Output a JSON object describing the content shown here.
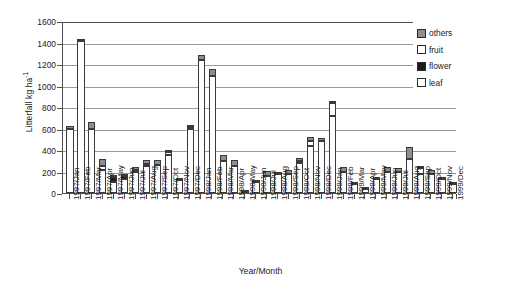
{
  "chart_data": {
    "type": "bar",
    "stacked": true,
    "title": "",
    "xlabel": "Year/Month",
    "ylabel": "Litterfall kg ha-1",
    "ylabel_html": "Litterfall kg ha<sup>-1</sup>",
    "ylim": [
      0,
      1600
    ],
    "ytick_step": 200,
    "yticks": [
      0,
      200,
      400,
      600,
      800,
      1000,
      1200,
      1400,
      1600
    ],
    "grid": true,
    "grid_axis": "y",
    "legend_position": "top-right",
    "legend": [
      "others",
      "fruit",
      "flower",
      "leaf"
    ],
    "series_order_bottom_to_top": [
      "leaf",
      "flower",
      "fruit",
      "others"
    ],
    "colors": {
      "leaf": "#ffffff",
      "flower": "#1c1c1c",
      "fruit": "#ffffff",
      "others": "#8f8f8f",
      "outline": "#3a3a3a",
      "axis": "#4d4d4d",
      "gridline": "#9a9a9a",
      "background": "#ffffff"
    },
    "categories": [
      "1997/Jan",
      "1997/Feb",
      "1997/Mar",
      "1997/Apr",
      "1997/May",
      "1997/Jun",
      "1997/Jul",
      "1997/Aug",
      "1997/Sep",
      "1997/Oct",
      "1997/Nov",
      "1997/Dec",
      "1998/Jan",
      "1998/Feb",
      "1998/Mar",
      "1998/Apr",
      "1998/May",
      "1998/Jun",
      "1998/Jul",
      "1998/Aug",
      "1998/Sep",
      "1998/Oct",
      "1998/Nov",
      "1998/Dec",
      "1999/Jan",
      "1999/Feb",
      "1999/Mar",
      "1999/Apr",
      "1999/May",
      "1999/Jun",
      "1999/Jul",
      "1999/Aug",
      "1999/Sep",
      "1999/Oct",
      "1999/Nov",
      "1999/Dec"
    ],
    "series": [
      {
        "name": "leaf",
        "values": [
          600,
          1415,
          600,
          210,
          100,
          135,
          200,
          255,
          265,
          350,
          120,
          600,
          1240,
          1090,
          295,
          255,
          10,
          105,
          160,
          175,
          180,
          275,
          440,
          480,
          720,
          200,
          85,
          40,
          130,
          195,
          195,
          320,
          175,
          180,
          130,
          85
        ]
      },
      {
        "name": "flower",
        "values": [
          0,
          0,
          0,
          0,
          45,
          20,
          10,
          15,
          0,
          0,
          0,
          0,
          0,
          0,
          0,
          0,
          0,
          0,
          0,
          0,
          0,
          0,
          0,
          0,
          0,
          0,
          0,
          0,
          0,
          0,
          0,
          0,
          0,
          0,
          0,
          0
        ]
      },
      {
        "name": "fruit",
        "values": [
          0,
          0,
          0,
          45,
          0,
          0,
          0,
          0,
          0,
          30,
          5,
          15,
          0,
          0,
          0,
          0,
          0,
          0,
          0,
          0,
          0,
          20,
          45,
          0,
          115,
          0,
          0,
          0,
          0,
          0,
          0,
          0,
          55,
          0,
          0,
          0
        ]
      },
      {
        "name": "others",
        "values": [
          25,
          20,
          60,
          60,
          20,
          15,
          30,
          35,
          45,
          20,
          10,
          20,
          45,
          60,
          60,
          55,
          15,
          20,
          45,
          25,
          35,
          35,
          40,
          30,
          25,
          40,
          10,
          15,
          20,
          45,
          35,
          105,
          25,
          30,
          15,
          10
        ]
      }
    ],
    "totals": [
      625,
      1435,
      660,
      315,
      165,
      170,
      240,
      305,
      310,
      400,
      135,
      635,
      1285,
      1150,
      355,
      310,
      25,
      125,
      205,
      200,
      215,
      330,
      525,
      510,
      860,
      240,
      95,
      55,
      150,
      240,
      230,
      425,
      255,
      210,
      145,
      95
    ]
  }
}
